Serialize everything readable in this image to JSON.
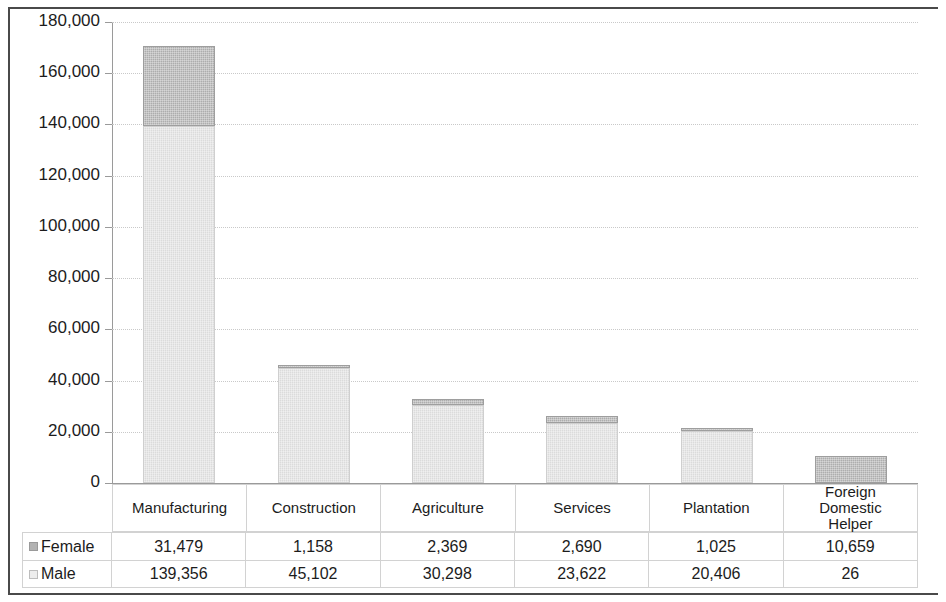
{
  "chart_data": {
    "type": "bar",
    "subtype": "stacked-column",
    "title": "",
    "xlabel": "",
    "ylabel": "",
    "ylim": [
      0,
      180000
    ],
    "ytick_step": 20000,
    "ytick_labels": [
      "180,000",
      "160,000",
      "140,000",
      "120,000",
      "100,000",
      "80,000",
      "60,000",
      "40,000",
      "20,000",
      "0"
    ],
    "ytick_values": [
      180000,
      160000,
      140000,
      120000,
      100000,
      80000,
      60000,
      40000,
      20000,
      0
    ],
    "grid": true,
    "legend_position": "table-left",
    "categories": [
      "Manufacturing",
      "Construction",
      "Agriculture",
      "Services",
      "Plantation",
      "Foreign Domestic Helper"
    ],
    "series": [
      {
        "name": "Female",
        "color": "#b3b3b3",
        "values": [
          31479,
          1158,
          2369,
          2690,
          1025,
          10659
        ],
        "labels": [
          "31,479",
          "1,158",
          "2,369",
          "2,690",
          "1,025",
          "10,659"
        ]
      },
      {
        "name": "Male",
        "color": "#e2e2e2",
        "values": [
          139356,
          45102,
          30298,
          23622,
          20406,
          26
        ],
        "labels": [
          "139,356",
          "45,102",
          "30,298",
          "23,622",
          "20,406",
          "26"
        ]
      }
    ],
    "stack_order_bottom_to_top": [
      "Male",
      "Female"
    ]
  },
  "axis": {
    "y_labels": [
      "180,000",
      "160,000",
      "140,000",
      "120,000",
      "100,000",
      "80,000",
      "60,000",
      "40,000",
      "20,000",
      "0"
    ]
  },
  "categories_display": [
    "Manufacturing",
    "Construction",
    "Agriculture",
    "Services",
    "Plantation",
    "Foreign\nDomestic\nHelper"
  ],
  "table": {
    "rows": [
      {
        "label": "Female",
        "swatch": "female-swatch",
        "cells": [
          "31,479",
          "1,158",
          "2,369",
          "2,690",
          "1,025",
          "10,659"
        ]
      },
      {
        "label": "Male",
        "swatch": "male-swatch",
        "cells": [
          "139,356",
          "45,102",
          "30,298",
          "23,622",
          "20,406",
          "26"
        ]
      }
    ]
  }
}
